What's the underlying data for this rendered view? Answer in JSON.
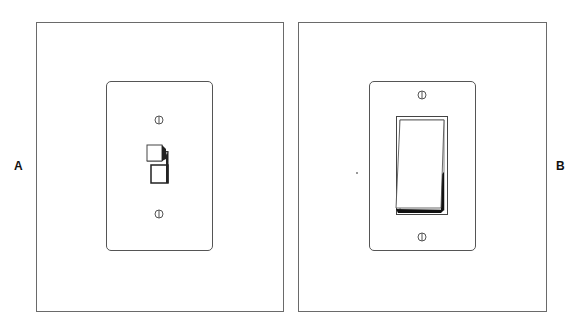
{
  "panels": [
    {
      "id": "A",
      "label": "A",
      "switch_type": "toggle-switch"
    },
    {
      "id": "B",
      "label": "B",
      "switch_type": "rocker-switch"
    }
  ],
  "colors": {
    "line": "#555555",
    "frame": "#6a6a6a",
    "shadow": "#1a1a1a",
    "background": "#ffffff"
  }
}
